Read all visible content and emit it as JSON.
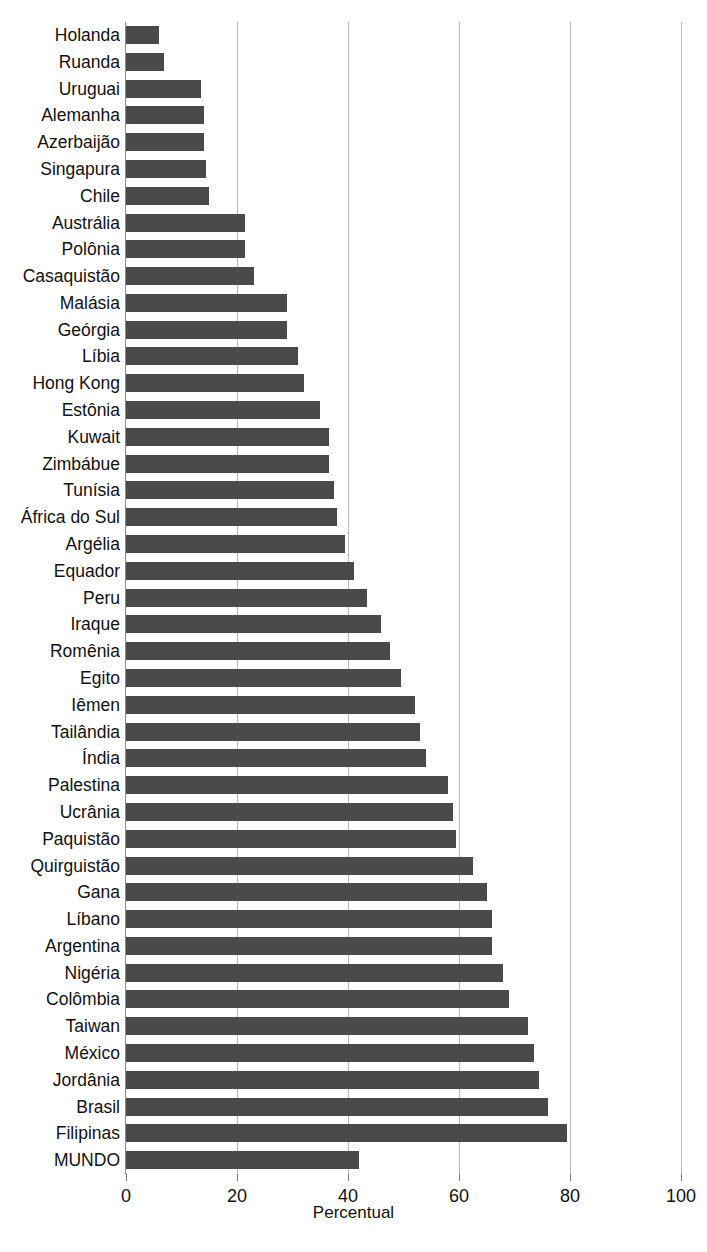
{
  "chart_title": "",
  "axis": {
    "x_label": "Percentual",
    "x_ticks": [
      "0",
      "20",
      "40",
      "60",
      "80",
      "100"
    ],
    "x_tick_values": [
      0,
      20,
      40,
      60,
      80,
      100
    ],
    "x_min": 0,
    "x_max": 100
  },
  "colors": {
    "bar": "#4a4a4a",
    "gridline": "#b9b9b9",
    "axis": "#8d8d8d",
    "background": "#ffffff",
    "text": "#111111"
  },
  "chart_data": {
    "type": "bar",
    "orientation": "horizontal",
    "title": "",
    "xlabel": "Percentual",
    "ylabel": "",
    "xlim": [
      0,
      100
    ],
    "grid": true,
    "legend": "none",
    "categories": [
      "Holanda",
      "Ruanda",
      "Uruguai",
      "Alemanha",
      "Azerbaijão",
      "Singapura",
      "Chile",
      "Austrália",
      "Polônia",
      "Casaquistão",
      "Malásia",
      "Geórgia",
      "Líbia",
      "Hong Kong",
      "Estônia",
      "Kuwait",
      "Zimbábue",
      "Tunísia",
      "África do Sul",
      "Argélia",
      "Equador",
      "Peru",
      "Iraque",
      "Romênia",
      "Egito",
      "Iêmen",
      "Tailândia",
      "Índia",
      "Palestina",
      "Ucrânia",
      "Paquistão",
      "Quirguistão",
      "Gana",
      "Líbano",
      "Argentina",
      "Nigéria",
      "Colômbia",
      "Taiwan",
      "México",
      "Jordânia",
      "Brasil",
      "Filipinas",
      "MUNDO"
    ],
    "values": [
      6.0,
      6.8,
      13.5,
      14.0,
      14.0,
      14.5,
      15.0,
      21.5,
      21.5,
      23.0,
      29.0,
      29.0,
      31.0,
      32.0,
      35.0,
      36.5,
      36.5,
      37.5,
      38.0,
      39.5,
      41.0,
      43.5,
      46.0,
      47.5,
      49.5,
      52.0,
      53.0,
      54.0,
      58.0,
      59.0,
      59.5,
      62.5,
      65.0,
      66.0,
      66.0,
      68.0,
      69.0,
      72.5,
      73.5,
      74.5,
      76.0,
      79.5,
      42.0
    ]
  }
}
